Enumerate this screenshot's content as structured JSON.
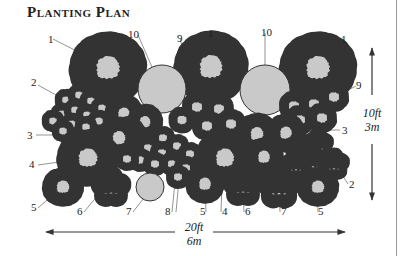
{
  "title": "Planting Plan",
  "dimensions": {
    "vertical": {
      "ft": "10ft",
      "m": "3m"
    },
    "horizontal": {
      "ft": "20ft",
      "m": "6m"
    }
  },
  "colors": {
    "plant_fill": "#c9c9c9",
    "plant_dark_fill": "#8c8c8c",
    "outline": "#333333",
    "leader": "#666666"
  },
  "labels": [
    {
      "id": "l1a",
      "text": "1",
      "x": 48,
      "y": 43
    },
    {
      "id": "l10a",
      "text": "10",
      "x": 129,
      "y": 38
    },
    {
      "id": "l9a",
      "text": "9",
      "x": 177,
      "y": 42
    },
    {
      "id": "l1b",
      "text": "1",
      "x": 210,
      "y": 37
    },
    {
      "id": "l10b",
      "text": "10",
      "x": 266,
      "y": 37
    },
    {
      "id": "l1c",
      "text": "1",
      "x": 341,
      "y": 43
    },
    {
      "id": "l2a",
      "text": "2",
      "x": 32,
      "y": 84
    },
    {
      "id": "l9b",
      "text": "9",
      "x": 356,
      "y": 89
    },
    {
      "id": "l3a",
      "text": "3",
      "x": 28,
      "y": 137
    },
    {
      "id": "l3b",
      "text": "3",
      "x": 343,
      "y": 131
    },
    {
      "id": "l4a",
      "text": "4",
      "x": 30,
      "y": 166
    },
    {
      "id": "l2b",
      "text": "2",
      "x": 349,
      "y": 188
    },
    {
      "id": "l5a",
      "text": "5",
      "x": 31,
      "y": 211
    },
    {
      "id": "l6a",
      "text": "6",
      "x": 78,
      "y": 214
    },
    {
      "id": "l7a",
      "text": "7",
      "x": 127,
      "y": 214
    },
    {
      "id": "l8",
      "text": "8",
      "x": 166,
      "y": 214
    },
    {
      "id": "l5b",
      "text": "5",
      "x": 202,
      "y": 214
    },
    {
      "id": "l4b",
      "text": "4",
      "x": 223,
      "y": 214
    },
    {
      "id": "l6b",
      "text": "6",
      "x": 246,
      "y": 214
    },
    {
      "id": "l7b",
      "text": "7",
      "x": 282,
      "y": 214
    },
    {
      "id": "l5c",
      "text": "5",
      "x": 320,
      "y": 214
    }
  ]
}
